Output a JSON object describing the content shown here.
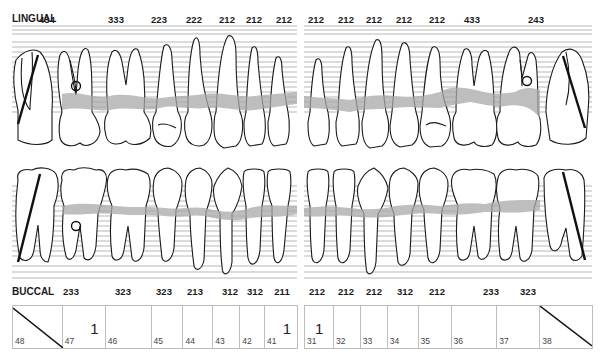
{
  "chart_title": "Periodontal chart — mandibular teeth",
  "lingual": {
    "label": "LINGUAL",
    "left_quadrant": [
      {
        "tooth": "48",
        "value": "434",
        "x": 47
      },
      {
        "tooth": "47",
        "value": "333",
        "x": 116
      },
      {
        "tooth": "46",
        "value": "223",
        "x": 159
      },
      {
        "tooth": "45",
        "value": "222",
        "x": 194
      },
      {
        "tooth": "44",
        "value": "212",
        "x": 227
      },
      {
        "tooth": "43",
        "value": "212",
        "x": 254
      },
      {
        "tooth": "42",
        "value": "212",
        "x": 284
      }
    ],
    "right_quadrant": [
      {
        "tooth": "32",
        "value": "212",
        "x": 316
      },
      {
        "tooth": "33",
        "value": "212",
        "x": 346
      },
      {
        "tooth": "34",
        "value": "212",
        "x": 374
      },
      {
        "tooth": "35",
        "value": "212",
        "x": 404
      },
      {
        "tooth": "36",
        "value": "212",
        "x": 437
      },
      {
        "tooth": "37",
        "value": "433",
        "x": 472
      },
      {
        "tooth": "38",
        "value": "243",
        "x": 536
      }
    ]
  },
  "buccal": {
    "label": "BUCCAL",
    "left_quadrant": [
      {
        "tooth": "47",
        "value": "233",
        "x": 71
      },
      {
        "tooth": "46",
        "value": "323",
        "x": 123
      },
      {
        "tooth": "45",
        "value": "323",
        "x": 164
      },
      {
        "tooth": "44",
        "value": "213",
        "x": 195
      },
      {
        "tooth": "43",
        "value": "312",
        "x": 230
      },
      {
        "tooth": "42",
        "value": "312",
        "x": 255
      },
      {
        "tooth": "41",
        "value": "211",
        "x": 282
      }
    ],
    "right_quadrant": [
      {
        "tooth": "31",
        "value": "212",
        "x": 317
      },
      {
        "tooth": "32",
        "value": "212",
        "x": 346
      },
      {
        "tooth": "33",
        "value": "212",
        "x": 374
      },
      {
        "tooth": "34",
        "value": "312",
        "x": 405
      },
      {
        "tooth": "35",
        "value": "212",
        "x": 437
      },
      {
        "tooth": "36",
        "value": "233",
        "x": 491
      },
      {
        "tooth": "37",
        "value": "323",
        "x": 528
      }
    ]
  },
  "mobility_table": {
    "left": [
      {
        "tooth": "48",
        "value": "",
        "missing": true
      },
      {
        "tooth": "47",
        "value": "1"
      },
      {
        "tooth": "46",
        "value": ""
      },
      {
        "tooth": "45",
        "value": ""
      },
      {
        "tooth": "44",
        "value": ""
      },
      {
        "tooth": "43",
        "value": ""
      },
      {
        "tooth": "42",
        "value": ""
      },
      {
        "tooth": "41",
        "value": "1"
      }
    ],
    "right": [
      {
        "tooth": "31",
        "value": "1"
      },
      {
        "tooth": "32",
        "value": ""
      },
      {
        "tooth": "33",
        "value": ""
      },
      {
        "tooth": "34",
        "value": ""
      },
      {
        "tooth": "35",
        "value": ""
      },
      {
        "tooth": "36",
        "value": ""
      },
      {
        "tooth": "37",
        "value": ""
      },
      {
        "tooth": "38",
        "value": "",
        "missing": true
      }
    ]
  },
  "colors": {
    "outline": "#1a1a1a",
    "grid_line": "#9a9a9a",
    "bone_band": "#a8a8a8",
    "cell_border": "#bdbdbd"
  }
}
